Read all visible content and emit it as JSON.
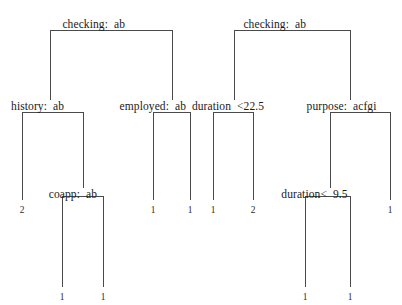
{
  "diagram": {
    "type": "decision-tree",
    "title": "",
    "line_color": "#4a4a4a",
    "text_color": "#1a1a1a",
    "background": "#ffffff",
    "internal_nodes": [
      {
        "id": "root-left",
        "label": "checking: ab",
        "variable": "checking",
        "condition": "ab",
        "left_text": "checking:",
        "right_text": "ab",
        "x": 111,
        "y": 18,
        "split_x": 111,
        "bracket_left": 50,
        "bracket_right": 172,
        "bracket_y": 30
      },
      {
        "id": "root-right",
        "label": "checking: ab",
        "variable": "checking",
        "condition": "ab",
        "left_text": "checking:",
        "right_text": "ab",
        "x": 292,
        "y": 18,
        "split_x": 292,
        "bracket_left": 234,
        "bracket_right": 350,
        "bracket_y": 30
      },
      {
        "id": "history",
        "label": "history: ab",
        "variable": "history",
        "condition": "ab",
        "left_text": "history:",
        "right_text": "ab",
        "x": 50,
        "y": 100,
        "split_x": 50,
        "bracket_left": 22,
        "bracket_right": 83,
        "bracket_y": 112
      },
      {
        "id": "employed",
        "label": "employed: ab",
        "variable": "employed",
        "condition": "ab",
        "left_text": "employed:",
        "right_text": "ab",
        "x": 172,
        "y": 100,
        "split_x": 172,
        "bracket_left": 153,
        "bracket_right": 190,
        "bracket_y": 112
      },
      {
        "id": "duration225",
        "label": "duration <22.5",
        "variable": "duration",
        "condition": "<22.5",
        "left_text": "duration",
        "right_text": "<22.5",
        "x": 234,
        "y": 100,
        "split_x": 234,
        "bracket_left": 213,
        "bracket_right": 253,
        "bracket_y": 112
      },
      {
        "id": "purpose",
        "label": "purpose: acfgi",
        "variable": "purpose",
        "condition": "acfgi",
        "left_text": "purpose:",
        "right_text": "acfgi",
        "x": 350,
        "y": 100,
        "split_x": 350,
        "bracket_left": 330,
        "bracket_right": 390,
        "bracket_y": 112
      },
      {
        "id": "coapp",
        "label": "coapp: ab",
        "variable": "coapp",
        "condition": "ab",
        "left_text": "coapp:",
        "right_text": "ab",
        "x": 83,
        "y": 188,
        "split_x": 83,
        "bracket_left": 62,
        "bracket_right": 103,
        "bracket_y": 196
      },
      {
        "id": "duration95",
        "label": "duration< 9.5",
        "variable": "duration",
        "condition": "< 9.5",
        "left_text": "duration<",
        "right_text": "9.5",
        "x": 330,
        "y": 188,
        "split_x": 330,
        "bracket_left": 305,
        "bracket_right": 350,
        "bracket_y": 196
      }
    ],
    "leaves": [
      {
        "id": "leaf-1",
        "value": "2",
        "x": 22,
        "y": 205,
        "stem_top": 112
      },
      {
        "id": "leaf-2",
        "value": "1",
        "x": 153,
        "y": 205,
        "stem_top": 112
      },
      {
        "id": "leaf-3",
        "value": "1",
        "x": 190,
        "y": 205,
        "stem_top": 112
      },
      {
        "id": "leaf-4",
        "value": "1",
        "x": 213,
        "y": 205,
        "stem_top": 112
      },
      {
        "id": "leaf-5",
        "value": "2",
        "x": 253,
        "y": 205,
        "stem_top": 112
      },
      {
        "id": "leaf-6",
        "value": "1",
        "x": 390,
        "y": 205,
        "stem_top": 112
      },
      {
        "id": "leaf-7",
        "value": "1",
        "x": 62,
        "y": 292,
        "stem_top": 196
      },
      {
        "id": "leaf-8",
        "value": "1",
        "x": 103,
        "y": 292,
        "stem_top": 196
      },
      {
        "id": "leaf-9",
        "value": "1",
        "x": 305,
        "y": 292,
        "stem_top": 196
      },
      {
        "id": "leaf-10",
        "value": "1",
        "x": 350,
        "y": 292,
        "stem_top": 196
      }
    ],
    "edges": [
      {
        "id": "edge-root-left-bracket",
        "type": "horizontal",
        "x1": 50,
        "x2": 172,
        "y": 30
      },
      {
        "id": "edge-root-left-stem-l",
        "type": "vertical",
        "x": 50,
        "y1": 30,
        "y2": 100
      },
      {
        "id": "edge-root-left-stem-r",
        "type": "vertical",
        "x": 172,
        "y1": 30,
        "y2": 100
      },
      {
        "id": "edge-root-right-bracket",
        "type": "horizontal",
        "x1": 234,
        "x2": 350,
        "y": 30
      },
      {
        "id": "edge-root-right-stem-l",
        "type": "vertical",
        "x": 234,
        "y1": 30,
        "y2": 100
      },
      {
        "id": "edge-root-right-stem-r",
        "type": "vertical",
        "x": 350,
        "y1": 30,
        "y2": 100
      },
      {
        "id": "edge-history-bracket",
        "type": "horizontal",
        "x1": 22,
        "x2": 83,
        "y": 112
      },
      {
        "id": "edge-history-stem-l",
        "type": "vertical",
        "x": 22,
        "y1": 112,
        "y2": 200
      },
      {
        "id": "edge-history-stem-r",
        "type": "vertical",
        "x": 83,
        "y1": 112,
        "y2": 188
      },
      {
        "id": "edge-employed-bracket",
        "type": "horizontal",
        "x1": 153,
        "x2": 190,
        "y": 112
      },
      {
        "id": "edge-employed-stem-l",
        "type": "vertical",
        "x": 153,
        "y1": 112,
        "y2": 200
      },
      {
        "id": "edge-employed-stem-r",
        "type": "vertical",
        "x": 190,
        "y1": 112,
        "y2": 200
      },
      {
        "id": "edge-duration225-bracket",
        "type": "horizontal",
        "x1": 213,
        "x2": 253,
        "y": 112
      },
      {
        "id": "edge-duration225-stem-l",
        "type": "vertical",
        "x": 213,
        "y1": 112,
        "y2": 200
      },
      {
        "id": "edge-duration225-stem-r",
        "type": "vertical",
        "x": 253,
        "y1": 112,
        "y2": 200
      },
      {
        "id": "edge-purpose-bracket",
        "type": "horizontal",
        "x1": 330,
        "x2": 390,
        "y": 112
      },
      {
        "id": "edge-purpose-stem-l",
        "type": "vertical",
        "x": 330,
        "y1": 112,
        "y2": 188
      },
      {
        "id": "edge-purpose-stem-r",
        "type": "vertical",
        "x": 390,
        "y1": 112,
        "y2": 200
      },
      {
        "id": "edge-coapp-bracket",
        "type": "horizontal",
        "x1": 62,
        "x2": 103,
        "y": 196
      },
      {
        "id": "edge-coapp-stem-l",
        "type": "vertical",
        "x": 62,
        "y1": 196,
        "y2": 287
      },
      {
        "id": "edge-coapp-stem-r",
        "type": "vertical",
        "x": 103,
        "y1": 196,
        "y2": 287
      },
      {
        "id": "edge-duration95-bracket",
        "type": "horizontal",
        "x1": 305,
        "x2": 350,
        "y": 196
      },
      {
        "id": "edge-duration95-stem-l",
        "type": "vertical",
        "x": 305,
        "y1": 196,
        "y2": 287
      },
      {
        "id": "edge-duration95-stem-r",
        "type": "vertical",
        "x": 350,
        "y1": 196,
        "y2": 287
      }
    ]
  }
}
